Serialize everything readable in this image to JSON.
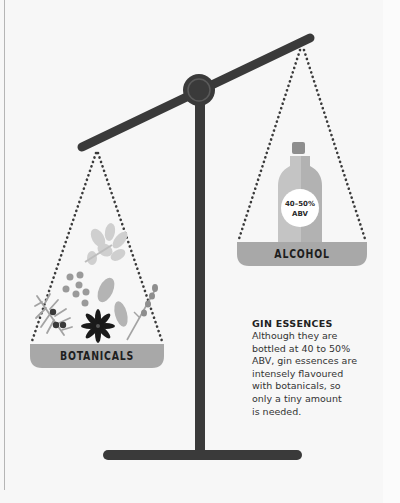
{
  "illustration": {
    "subject": "balance-scale",
    "colors": {
      "background": "#f7f7f7",
      "beam": "#3a3a3a",
      "pan": "#a8a8a8",
      "chain_dots": "#3a3a3a",
      "bottle_light": "#c4c4c4",
      "bottle_dark": "#b2b2b2",
      "bottle_cap": "#8e8e8e",
      "star_anise": "#1a1a1a"
    },
    "left_pan": {
      "label": "BOTANICALS",
      "items": [
        "juniper-sprig",
        "coriander-seeds",
        "star-anise",
        "cardamom-pods",
        "angelica-flower",
        "lavender-sprig"
      ]
    },
    "right_pan": {
      "label": "ALCOHOL",
      "bottle_badge": {
        "line1": "40–50%",
        "line2": "ABV"
      }
    }
  },
  "note": {
    "title": "GIN ESSENCES",
    "lines": [
      "Although they are",
      "bottled at 40 to 50%",
      "ABV, gin essences are",
      "intensely flavoured",
      "with botanicals, so",
      "only a tiny amount",
      "is needed."
    ]
  }
}
